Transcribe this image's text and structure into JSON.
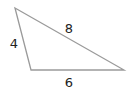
{
  "diagram": {
    "type": "triangle",
    "stroke_color": "#9a9a9a",
    "label_color": "#222222",
    "vertices": [
      {
        "name": "top",
        "x": 15,
        "y": 8
      },
      {
        "name": "bottom-left",
        "x": 31,
        "y": 70
      },
      {
        "name": "bottom-right",
        "x": 124,
        "y": 70
      }
    ],
    "sides": [
      {
        "name": "left",
        "label": "4"
      },
      {
        "name": "top",
        "label": "8"
      },
      {
        "name": "bottom",
        "label": "6"
      }
    ]
  }
}
